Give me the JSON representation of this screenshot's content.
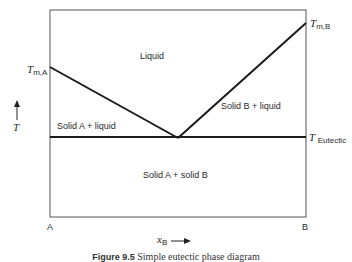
{
  "diagram": {
    "type": "phase-diagram",
    "title": "Simple eutectic phase diagram",
    "regions": {
      "liquid": "Liquid",
      "solid_a_liquid": "Solid A + liquid",
      "solid_b_liquid": "Solid B + liquid",
      "solid_a_solid_b": "Solid A + solid B"
    },
    "temperature_labels": {
      "tm_a": {
        "symbol": "T",
        "subscript": "m,A"
      },
      "tm_b": {
        "symbol": "T",
        "subscript": "m,B"
      },
      "eutectic": {
        "symbol": "T",
        "subscript": "Eutectic"
      }
    },
    "axes": {
      "y_label": "T",
      "x_label_symbol": "x",
      "x_label_subscript": "B",
      "x_left": "A",
      "x_right": "B"
    },
    "caption": {
      "number": "Figure 9.5",
      "text": "Simple eutectic phase diagram"
    },
    "colors": {
      "line": "#1a1a1a",
      "frame": "#555555",
      "background": "#ffffff"
    }
  }
}
